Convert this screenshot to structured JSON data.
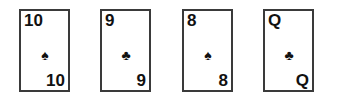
{
  "hand": {
    "cards": [
      {
        "rank": "10",
        "suit": "spades",
        "suit_glyph": "♠",
        "x": 19
      },
      {
        "rank": "9",
        "suit": "clubs",
        "suit_glyph": "♣",
        "x": 100
      },
      {
        "rank": "8",
        "suit": "spades",
        "suit_glyph": "♠",
        "x": 182
      },
      {
        "rank": "Q",
        "suit": "clubs",
        "suit_glyph": "♣",
        "x": 263
      }
    ]
  },
  "colors": {
    "card_border": "#3a3a3a",
    "ink": "#111111",
    "background": "#ffffff"
  }
}
